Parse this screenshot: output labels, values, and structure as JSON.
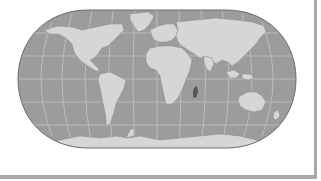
{
  "figure": {
    "type": "world-map",
    "projection": "pseudo-cylindrical (rounded sides)",
    "style": "grayscale",
    "colors": {
      "ocean": "#9c9c9c",
      "land": "#d6d6d6",
      "graticule": "#c4c4c4",
      "outline": "#6e6e6e",
      "island_dark": "#555555",
      "frame": "#a8a8a8",
      "background": "#ffffff"
    },
    "graticule": {
      "parallels": 5,
      "meridians": 11
    },
    "highlighted_feature": "Madagascar (dark)"
  }
}
